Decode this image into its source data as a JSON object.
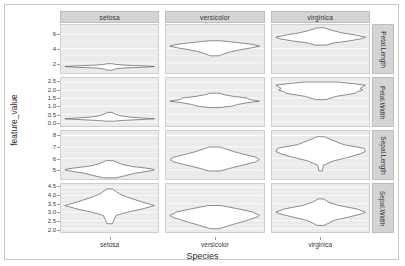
{
  "axes": {
    "y_title": "feature_value",
    "x_title": "Species",
    "x_categories": [
      "setosa",
      "versicolor",
      "virginica"
    ]
  },
  "strips": {
    "top": [
      "setosa",
      "versicolor",
      "virginica"
    ],
    "right": [
      "Petal.Length",
      "Petal.Width",
      "Sepal.Length",
      "Sepal.Width"
    ]
  },
  "rows": [
    {
      "feature": "Petal.Length",
      "ticks": [
        "6",
        "4",
        "2"
      ],
      "tick_values": [
        6,
        4,
        2
      ],
      "ylim": [
        0.6,
        7.3
      ]
    },
    {
      "feature": "Petal.Width",
      "ticks": [
        "2.5",
        "2.0",
        "1.5",
        "1.0",
        "0.5",
        "0.0"
      ],
      "tick_values": [
        2.5,
        2.0,
        1.5,
        1.0,
        0.5,
        0.0
      ],
      "ylim": [
        -0.25,
        2.75
      ]
    },
    {
      "feature": "Sepal.Length",
      "ticks": [
        "8",
        "7",
        "6",
        "5"
      ],
      "tick_values": [
        8,
        7,
        6,
        5
      ],
      "ylim": [
        4.2,
        8.4
      ]
    },
    {
      "feature": "Sepal.Width",
      "ticks": [
        "4.5",
        "4.0",
        "3.5",
        "3.0",
        "2.5",
        "2.0"
      ],
      "tick_values": [
        4.5,
        4.0,
        3.5,
        3.0,
        2.5,
        2.0
      ],
      "ylim": [
        1.8,
        4.7
      ]
    }
  ],
  "chart_data": {
    "type": "violin",
    "title": "",
    "xlabel": "Species",
    "ylabel": "feature_value",
    "grid": true,
    "legend": "none",
    "facet_rows": [
      "Petal.Length",
      "Petal.Width",
      "Sepal.Length",
      "Sepal.Width"
    ],
    "facet_cols": [
      "setosa",
      "versicolor",
      "virginica"
    ],
    "panels": [
      {
        "row": "Petal.Length",
        "col": "setosa",
        "ylim": [
          0.6,
          7.3
        ],
        "min": 1.0,
        "q1": 1.4,
        "median": 1.5,
        "q3": 1.575,
        "max": 1.9,
        "density": [
          {
            "y": 1.0,
            "w": 0.06
          },
          {
            "y": 1.15,
            "w": 0.12
          },
          {
            "y": 1.3,
            "w": 0.3
          },
          {
            "y": 1.4,
            "w": 0.72
          },
          {
            "y": 1.5,
            "w": 1.0
          },
          {
            "y": 1.6,
            "w": 0.7
          },
          {
            "y": 1.7,
            "w": 0.32
          },
          {
            "y": 1.8,
            "w": 0.14
          },
          {
            "y": 1.9,
            "w": 0.05
          }
        ]
      },
      {
        "row": "Petal.Length",
        "col": "versicolor",
        "ylim": [
          0.6,
          7.3
        ],
        "min": 3.0,
        "q1": 4.0,
        "median": 4.35,
        "q3": 4.6,
        "max": 5.1,
        "density": [
          {
            "y": 3.0,
            "w": 0.1
          },
          {
            "y": 3.3,
            "w": 0.22
          },
          {
            "y": 3.6,
            "w": 0.38
          },
          {
            "y": 3.9,
            "w": 0.62
          },
          {
            "y": 4.1,
            "w": 0.82
          },
          {
            "y": 4.35,
            "w": 1.0
          },
          {
            "y": 4.6,
            "w": 0.84
          },
          {
            "y": 4.8,
            "w": 0.58
          },
          {
            "y": 5.0,
            "w": 0.28
          },
          {
            "y": 5.1,
            "w": 0.12
          }
        ]
      },
      {
        "row": "Petal.Length",
        "col": "virginica",
        "ylim": [
          0.6,
          7.3
        ],
        "min": 4.5,
        "q1": 5.1,
        "median": 5.55,
        "q3": 5.875,
        "max": 6.9,
        "density": [
          {
            "y": 4.5,
            "w": 0.12
          },
          {
            "y": 4.8,
            "w": 0.3
          },
          {
            "y": 5.1,
            "w": 0.66
          },
          {
            "y": 5.4,
            "w": 0.92
          },
          {
            "y": 5.6,
            "w": 1.0
          },
          {
            "y": 5.9,
            "w": 0.78
          },
          {
            "y": 6.2,
            "w": 0.48
          },
          {
            "y": 6.5,
            "w": 0.28
          },
          {
            "y": 6.9,
            "w": 0.08
          }
        ]
      },
      {
        "row": "Petal.Width",
        "col": "setosa",
        "ylim": [
          -0.25,
          2.75
        ],
        "min": 0.1,
        "q1": 0.2,
        "median": 0.2,
        "q3": 0.3,
        "max": 0.6,
        "density": [
          {
            "y": 0.05,
            "w": 0.08
          },
          {
            "y": 0.1,
            "w": 0.3
          },
          {
            "y": 0.2,
            "w": 1.0
          },
          {
            "y": 0.3,
            "w": 0.45
          },
          {
            "y": 0.4,
            "w": 0.22
          },
          {
            "y": 0.5,
            "w": 0.12
          },
          {
            "y": 0.6,
            "w": 0.05
          }
        ]
      },
      {
        "row": "Petal.Width",
        "col": "versicolor",
        "ylim": [
          -0.25,
          2.75
        ],
        "min": 1.0,
        "q1": 1.2,
        "median": 1.3,
        "q3": 1.5,
        "max": 1.8,
        "density": [
          {
            "y": 0.9,
            "w": 0.1
          },
          {
            "y": 1.0,
            "w": 0.4
          },
          {
            "y": 1.1,
            "w": 0.52
          },
          {
            "y": 1.2,
            "w": 0.72
          },
          {
            "y": 1.3,
            "w": 1.0
          },
          {
            "y": 1.4,
            "w": 0.78
          },
          {
            "y": 1.5,
            "w": 0.72
          },
          {
            "y": 1.6,
            "w": 0.42
          },
          {
            "y": 1.7,
            "w": 0.22
          },
          {
            "y": 1.8,
            "w": 0.1
          }
        ]
      },
      {
        "row": "Petal.Width",
        "col": "virginica",
        "ylim": [
          -0.25,
          2.75
        ],
        "min": 1.4,
        "q1": 1.8,
        "median": 2.0,
        "q3": 2.3,
        "max": 2.5,
        "density": [
          {
            "y": 1.4,
            "w": 0.12
          },
          {
            "y": 1.6,
            "w": 0.34
          },
          {
            "y": 1.8,
            "w": 0.78
          },
          {
            "y": 1.9,
            "w": 0.82
          },
          {
            "y": 2.0,
            "w": 0.94
          },
          {
            "y": 2.1,
            "w": 0.88
          },
          {
            "y": 2.3,
            "w": 1.0
          },
          {
            "y": 2.4,
            "w": 0.72
          },
          {
            "y": 2.5,
            "w": 0.36
          }
        ]
      },
      {
        "row": "Sepal.Length",
        "col": "setosa",
        "ylim": [
          4.2,
          8.4
        ],
        "min": 4.3,
        "q1": 4.8,
        "median": 5.0,
        "q3": 5.2,
        "max": 5.8,
        "density": [
          {
            "y": 4.3,
            "w": 0.14
          },
          {
            "y": 4.5,
            "w": 0.36
          },
          {
            "y": 4.7,
            "w": 0.56
          },
          {
            "y": 4.9,
            "w": 0.88
          },
          {
            "y": 5.0,
            "w": 1.0
          },
          {
            "y": 5.1,
            "w": 0.92
          },
          {
            "y": 5.3,
            "w": 0.5
          },
          {
            "y": 5.5,
            "w": 0.26
          },
          {
            "y": 5.8,
            "w": 0.08
          }
        ]
      },
      {
        "row": "Sepal.Length",
        "col": "versicolor",
        "ylim": [
          4.2,
          8.4
        ],
        "min": 4.9,
        "q1": 5.6,
        "median": 5.9,
        "q3": 6.3,
        "max": 7.0,
        "density": [
          {
            "y": 4.9,
            "w": 0.12
          },
          {
            "y": 5.2,
            "w": 0.4
          },
          {
            "y": 5.5,
            "w": 0.72
          },
          {
            "y": 5.7,
            "w": 0.92
          },
          {
            "y": 5.9,
            "w": 1.0
          },
          {
            "y": 6.1,
            "w": 0.92
          },
          {
            "y": 6.3,
            "w": 0.72
          },
          {
            "y": 6.6,
            "w": 0.42
          },
          {
            "y": 7.0,
            "w": 0.12
          }
        ]
      },
      {
        "row": "Sepal.Length",
        "col": "virginica",
        "ylim": [
          4.2,
          8.4
        ],
        "min": 4.9,
        "q1": 6.225,
        "median": 6.5,
        "q3": 6.9,
        "max": 7.9,
        "density": [
          {
            "y": 4.9,
            "w": 0.04
          },
          {
            "y": 5.4,
            "w": 0.06
          },
          {
            "y": 5.8,
            "w": 0.3
          },
          {
            "y": 6.1,
            "w": 0.62
          },
          {
            "y": 6.4,
            "w": 0.88
          },
          {
            "y": 6.6,
            "w": 1.0
          },
          {
            "y": 6.9,
            "w": 0.96
          },
          {
            "y": 7.2,
            "w": 0.52
          },
          {
            "y": 7.6,
            "w": 0.26
          },
          {
            "y": 7.9,
            "w": 0.08
          }
        ]
      },
      {
        "row": "Sepal.Width",
        "col": "setosa",
        "ylim": [
          1.8,
          4.7
        ],
        "min": 2.3,
        "q1": 3.2,
        "median": 3.4,
        "q3": 3.675,
        "max": 4.4,
        "density": [
          {
            "y": 2.3,
            "w": 0.06
          },
          {
            "y": 2.8,
            "w": 0.14
          },
          {
            "y": 3.0,
            "w": 0.4
          },
          {
            "y": 3.2,
            "w": 0.74
          },
          {
            "y": 3.4,
            "w": 1.0
          },
          {
            "y": 3.6,
            "w": 0.74
          },
          {
            "y": 3.9,
            "w": 0.4
          },
          {
            "y": 4.1,
            "w": 0.22
          },
          {
            "y": 4.4,
            "w": 0.06
          }
        ]
      },
      {
        "row": "Sepal.Width",
        "col": "versicolor",
        "ylim": [
          1.8,
          4.7
        ],
        "min": 2.0,
        "q1": 2.525,
        "median": 2.8,
        "q3": 3.0,
        "max": 3.4,
        "density": [
          {
            "y": 2.0,
            "w": 0.1
          },
          {
            "y": 2.2,
            "w": 0.34
          },
          {
            "y": 2.5,
            "w": 0.72
          },
          {
            "y": 2.7,
            "w": 0.94
          },
          {
            "y": 2.8,
            "w": 1.0
          },
          {
            "y": 3.0,
            "w": 0.86
          },
          {
            "y": 3.2,
            "w": 0.52
          },
          {
            "y": 3.4,
            "w": 0.14
          }
        ]
      },
      {
        "row": "Sepal.Width",
        "col": "virginica",
        "ylim": [
          1.8,
          4.7
        ],
        "min": 2.2,
        "q1": 2.8,
        "median": 3.0,
        "q3": 3.175,
        "max": 3.8,
        "density": [
          {
            "y": 2.2,
            "w": 0.08
          },
          {
            "y": 2.5,
            "w": 0.3
          },
          {
            "y": 2.7,
            "w": 0.62
          },
          {
            "y": 2.9,
            "w": 0.92
          },
          {
            "y": 3.0,
            "w": 1.0
          },
          {
            "y": 3.2,
            "w": 0.8
          },
          {
            "y": 3.4,
            "w": 0.4
          },
          {
            "y": 3.6,
            "w": 0.18
          },
          {
            "y": 3.8,
            "w": 0.06
          }
        ]
      }
    ]
  },
  "style": {
    "panel_bg": "#ebebeb",
    "grid_color": "#ffffff",
    "strip_bg": "#d4d4d4",
    "violin_fill": "#ffffff",
    "violin_stroke": "#5a5a5a"
  }
}
